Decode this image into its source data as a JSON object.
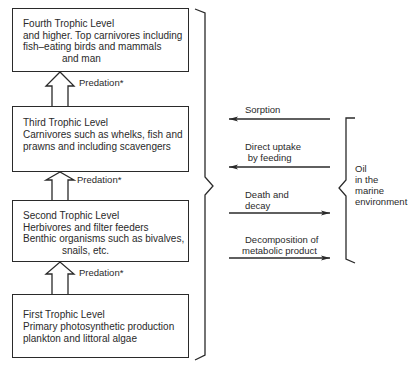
{
  "levels": [
    {
      "id": "fourth",
      "title": "Fourth Trophic Level",
      "lines": [
        "and higher. Top carnivores including",
        "fish–eating birds and mammals",
        "              and man"
      ]
    },
    {
      "id": "third",
      "title": "Third Trophic Level",
      "lines": [
        "Carnivores such as whelks, fish and",
        "prawns and including scavengers"
      ]
    },
    {
      "id": "second",
      "title": "Second Trophic Level",
      "lines": [
        "Herbivores and filter feeders",
        "Benthic organisms such as bivalves,",
        "              snails, etc."
      ]
    },
    {
      "id": "first",
      "title": "First Trophic Level",
      "lines": [
        "Primary photosynthetic production",
        "plankton and littoral algae"
      ]
    }
  ],
  "predation_label": "Predation*",
  "processes": [
    {
      "label_1": "Sorption",
      "label_2": "",
      "direction": "left"
    },
    {
      "label_1": "Direct uptake",
      "label_2": " by feeding",
      "direction": "left"
    },
    {
      "label_1": "Death and",
      "label_2": "decay",
      "direction": "right"
    },
    {
      "label_1": "Decomposition of",
      "label_2": "metabolic product",
      "direction": "right"
    }
  ],
  "oil": {
    "line_1": "Oil",
    "line_2": "in the",
    "line_3": "marine",
    "line_4": "environment"
  },
  "colors": {
    "ink": "#2a2a2a",
    "background": "#ffffff"
  }
}
